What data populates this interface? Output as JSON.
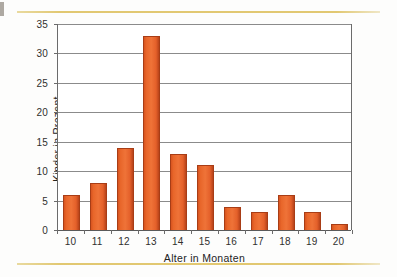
{
  "chart_data": {
    "type": "bar",
    "title": "",
    "xlabel": "Alter in Monaten",
    "ylabel": "Kinder in Prozent",
    "categories": [
      "10",
      "11",
      "12",
      "13",
      "14",
      "15",
      "16",
      "17",
      "18",
      "19",
      "20"
    ],
    "values": [
      6,
      8,
      14,
      33,
      13,
      11,
      4,
      3,
      6,
      3,
      1
    ],
    "ylim": [
      0,
      35
    ],
    "yticks": [
      "0",
      "5",
      "10",
      "15",
      "20",
      "25",
      "30",
      "35"
    ],
    "ytick_values": [
      0,
      5,
      10,
      15,
      20,
      25,
      30,
      35
    ],
    "grid": true,
    "legend": false,
    "series_color": "#e8662a",
    "gridline_color": "#8b8b8b",
    "accent_rule_color": "#e0c56a"
  }
}
